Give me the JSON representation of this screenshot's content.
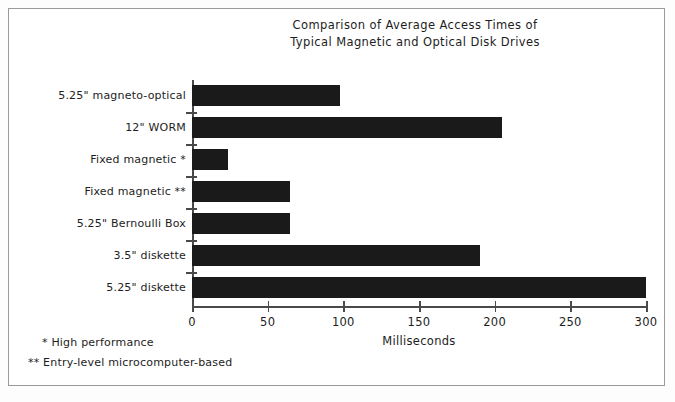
{
  "chart_data": {
    "type": "bar",
    "orientation": "horizontal",
    "title": "Comparison of Average Access Times of\nTypical Magnetic and Optical Disk Drives",
    "xlabel": "Milliseconds",
    "ylabel": "",
    "xlim": [
      0,
      300
    ],
    "xticks": [
      0,
      50,
      100,
      150,
      200,
      250,
      300
    ],
    "xtick_labels": [
      "0",
      "50",
      "100",
      "150",
      "200",
      "250",
      "300"
    ],
    "grid": false,
    "legend": false,
    "categories": [
      "5.25\" magneto-optical",
      "12\" WORM",
      "Fixed magnetic *",
      "Fixed magnetic **",
      "5.25\" Bernoulli Box",
      "3.5\" diskette",
      "5.25\" diskette"
    ],
    "values": [
      98,
      205,
      24,
      65,
      65,
      190,
      300
    ],
    "bar_color": "#1a1a1a",
    "annotations": [
      "* High performance",
      "** Entry-level microcomputer-based"
    ]
  },
  "footnotes": {
    "high_performance": "* High performance",
    "entry_level": "** Entry-level microcomputer-based"
  },
  "colors": {
    "bar": "#1a1a1a",
    "axis": "#4a4a4a",
    "border": "#9a9a9a",
    "background": "#ffffff",
    "text": "#1d1d1d"
  }
}
